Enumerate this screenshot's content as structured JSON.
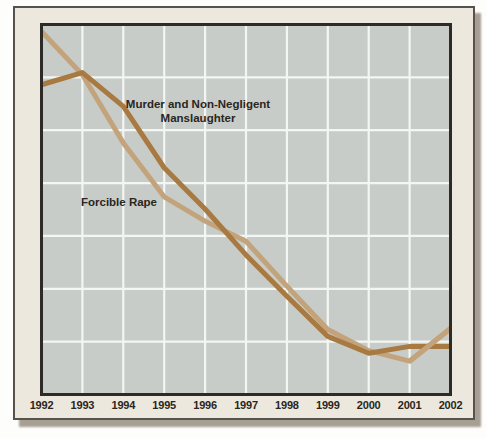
{
  "figure": {
    "x_axis_labels": [
      "1992",
      "1993",
      "1994",
      "1995",
      "1996",
      "1997",
      "1998",
      "1999",
      "2000",
      "2001",
      "2002"
    ]
  },
  "annotations": {
    "murder_line1": "Murder and Non-Negligent",
    "murder_line2": "Manslaughter",
    "rape_label": "Forcible Rape"
  },
  "colors": {
    "murder_line": "#a87a42",
    "rape_line": "#c2a37c",
    "plot_background": "#c7ccc8",
    "gridline": "#f4f6f3",
    "plot_border": "#2e2a25",
    "frame_background": "#ece8dd",
    "frame_border": "#57524b",
    "shadow": "#a89f94",
    "label_text": "#2a2621"
  },
  "chart_data": {
    "type": "line",
    "title": "",
    "xlabel": "",
    "ylabel": "",
    "y_axis_visible": false,
    "y_units": "grid rows above bottom axis (chart shows no numeric y scale)",
    "grid": true,
    "grid_rows": 7,
    "legend": "inline-labels",
    "categories": [
      "1992",
      "1993",
      "1994",
      "1995",
      "1996",
      "1997",
      "1998",
      "1999",
      "2000",
      "2001",
      "2002"
    ],
    "series": [
      {
        "name": "Murder and Non-Negligent Manslaughter",
        "color": "#a87a42",
        "values": [
          5.86,
          6.09,
          5.45,
          4.29,
          3.51,
          2.64,
          1.86,
          1.1,
          0.78,
          0.91,
          0.91
        ]
      },
      {
        "name": "Forcible Rape",
        "color": "#c2a37c",
        "values": [
          6.87,
          6.05,
          4.76,
          3.74,
          3.28,
          2.9,
          2.05,
          1.23,
          0.83,
          0.63,
          1.25
        ]
      }
    ],
    "shape_notes": "Murder line peaks in 1993, declines to a 2000 low, then levels flat through 2002. Forcible Rape starts highest in 1992, falls steeply to 1995, declines to a 2001 low, then rises sharply into 2002, crossing the murder line."
  }
}
